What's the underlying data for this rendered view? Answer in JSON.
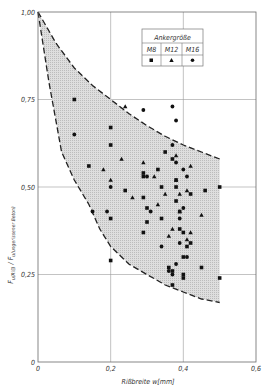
{
  "chart_data": {
    "type": "scatter",
    "title": "",
    "xlabel": "Rißbreite w[mm]",
    "ylabel": "F u(Riß) / F u(ungerissener Beton)",
    "ylabel_main": "F",
    "ylabel_sub1": "u(Riß)",
    "ylabel_sep": " / F",
    "ylabel_sub2": "u(ungerissener Beton)",
    "xlim": [
      0,
      0.6
    ],
    "ylim": [
      0,
      1.0
    ],
    "x_ticks": [
      "0",
      "0,2",
      "0,4",
      "0,6"
    ],
    "x_tick_values": [
      0,
      0.2,
      0.4,
      0.6
    ],
    "y_ticks": [
      "0",
      "0,25",
      "0,50",
      "0,75",
      "1,00"
    ],
    "y_tick_values": [
      0,
      0.25,
      0.5,
      0.75,
      1.0
    ],
    "grid": true,
    "legend": {
      "title": "Ankergröße",
      "entries": [
        {
          "label": "M8",
          "marker": "square"
        },
        {
          "label": "M12",
          "marker": "triangle"
        },
        {
          "label": "M16",
          "marker": "circle"
        }
      ],
      "position": "top-right"
    },
    "envelope": {
      "upper": [
        [
          0,
          1.0
        ],
        [
          0.05,
          0.91
        ],
        [
          0.1,
          0.84
        ],
        [
          0.15,
          0.79
        ],
        [
          0.2,
          0.75
        ],
        [
          0.25,
          0.71
        ],
        [
          0.3,
          0.675
        ],
        [
          0.35,
          0.645
        ],
        [
          0.4,
          0.62
        ],
        [
          0.45,
          0.6
        ],
        [
          0.5,
          0.58
        ]
      ],
      "lower": [
        [
          0,
          1.0
        ],
        [
          0.03,
          0.8
        ],
        [
          0.065,
          0.6
        ],
        [
          0.1,
          0.52
        ],
        [
          0.14,
          0.45
        ],
        [
          0.17,
          0.38
        ],
        [
          0.2,
          0.33
        ],
        [
          0.25,
          0.28
        ],
        [
          0.3,
          0.25
        ],
        [
          0.35,
          0.22
        ],
        [
          0.4,
          0.2
        ],
        [
          0.45,
          0.18
        ],
        [
          0.5,
          0.17
        ]
      ],
      "style": "dashed, shaded gray"
    },
    "series": [
      {
        "name": "M8",
        "marker": "square",
        "points": [
          [
            0.1,
            0.75
          ],
          [
            0.14,
            0.56
          ],
          [
            0.2,
            0.67
          ],
          [
            0.2,
            0.62
          ],
          [
            0.2,
            0.41
          ],
          [
            0.2,
            0.29
          ],
          [
            0.24,
            0.49
          ],
          [
            0.29,
            0.53
          ],
          [
            0.29,
            0.47
          ],
          [
            0.29,
            0.37
          ],
          [
            0.29,
            0.54
          ],
          [
            0.3,
            0.44
          ],
          [
            0.3,
            0.4
          ],
          [
            0.33,
            0.55
          ],
          [
            0.34,
            0.5
          ],
          [
            0.34,
            0.41
          ],
          [
            0.35,
            0.6
          ],
          [
            0.37,
            0.58
          ],
          [
            0.38,
            0.5
          ],
          [
            0.38,
            0.46
          ],
          [
            0.38,
            0.52
          ],
          [
            0.39,
            0.43
          ],
          [
            0.39,
            0.38
          ],
          [
            0.4,
            0.37
          ],
          [
            0.4,
            0.3
          ],
          [
            0.41,
            0.33
          ],
          [
            0.4,
            0.25
          ],
          [
            0.4,
            0.24
          ],
          [
            0.36,
            0.27
          ],
          [
            0.37,
            0.26
          ],
          [
            0.37,
            0.22
          ],
          [
            0.42,
            0.48
          ],
          [
            0.42,
            0.34
          ],
          [
            0.46,
            0.49
          ],
          [
            0.5,
            0.5
          ],
          [
            0.45,
            0.27
          ],
          [
            0.5,
            0.24
          ]
        ]
      },
      {
        "name": "M12",
        "marker": "triangle",
        "points": [
          [
            0.18,
            0.55
          ],
          [
            0.2,
            0.52
          ],
          [
            0.26,
            0.47
          ],
          [
            0.23,
            0.58
          ],
          [
            0.24,
            0.73
          ],
          [
            0.35,
            0.48
          ],
          [
            0.33,
            0.45
          ],
          [
            0.38,
            0.52
          ],
          [
            0.39,
            0.48
          ],
          [
            0.41,
            0.49
          ],
          [
            0.39,
            0.43
          ],
          [
            0.37,
            0.38
          ],
          [
            0.36,
            0.36
          ],
          [
            0.41,
            0.35
          ],
          [
            0.42,
            0.37
          ],
          [
            0.45,
            0.42
          ],
          [
            0.29,
            0.57
          ],
          [
            0.38,
            0.59
          ],
          [
            0.32,
            0.53
          ],
          [
            0.42,
            0.56
          ]
        ]
      },
      {
        "name": "M16",
        "marker": "circle",
        "points": [
          [
            0.1,
            0.65
          ],
          [
            0.15,
            0.43
          ],
          [
            0.19,
            0.43
          ],
          [
            0.2,
            0.5
          ],
          [
            0.29,
            0.72
          ],
          [
            0.3,
            0.53
          ],
          [
            0.37,
            0.73
          ],
          [
            0.37,
            0.62
          ],
          [
            0.38,
            0.69
          ],
          [
            0.38,
            0.57
          ],
          [
            0.4,
            0.55
          ],
          [
            0.4,
            0.44
          ],
          [
            0.39,
            0.41
          ],
          [
            0.39,
            0.34
          ],
          [
            0.38,
            0.28
          ],
          [
            0.36,
            0.26
          ],
          [
            0.34,
            0.33
          ],
          [
            0.41,
            0.3
          ],
          [
            0.41,
            0.53
          ],
          [
            0.31,
            0.43
          ],
          [
            0.37,
            0.25
          ]
        ]
      }
    ]
  },
  "style": {
    "axis_color": "#6a6a6a",
    "grid_color": "#9a9a9a",
    "fill_color": "#d8d8d8",
    "marker_color": "#111111",
    "curve_color": "#222222"
  }
}
